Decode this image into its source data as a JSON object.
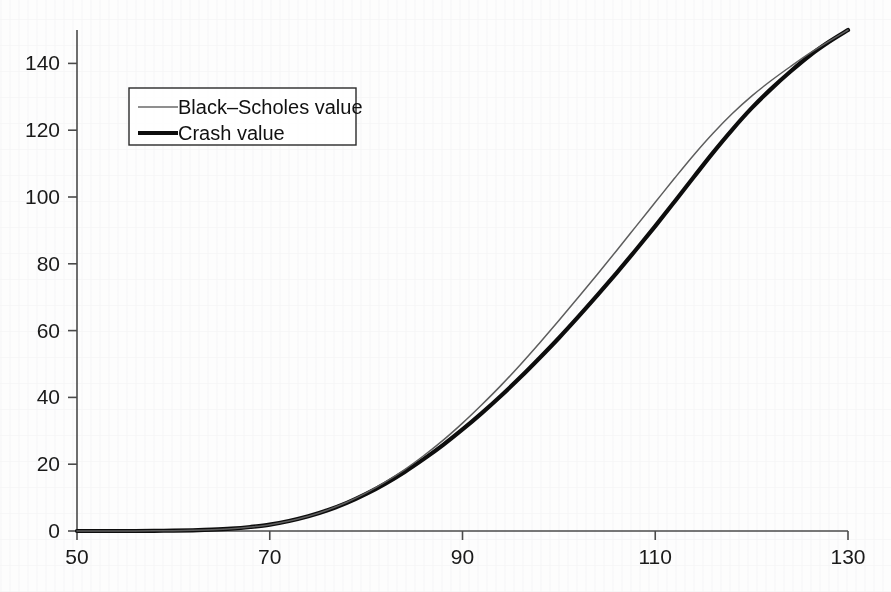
{
  "chart_data": {
    "type": "line",
    "title": "",
    "subtitle": "",
    "xlabel": "",
    "ylabel": "",
    "xlim": [
      50,
      130
    ],
    "ylim": [
      0,
      150
    ],
    "grid": false,
    "legend_position": "upper-left",
    "xticks": [
      50,
      70,
      90,
      110,
      130
    ],
    "xtick_labels": [
      "50",
      "70",
      "90",
      "110",
      "130"
    ],
    "yticks": [
      0,
      20,
      40,
      60,
      80,
      100,
      120,
      140
    ],
    "ytick_labels": [
      "0",
      "20",
      "40",
      "60",
      "80",
      "100",
      "120",
      "140"
    ],
    "x": [
      50,
      52,
      54,
      56,
      58,
      60,
      62,
      64,
      66,
      68,
      70,
      72,
      74,
      76,
      78,
      80,
      82,
      84,
      86,
      88,
      90,
      92,
      94,
      96,
      98,
      100,
      102,
      104,
      106,
      108,
      110,
      112,
      114,
      116,
      118,
      120,
      122,
      124,
      126,
      128,
      130
    ],
    "series": [
      {
        "name": "Black-Scholes value",
        "label": "Black–Scholes value",
        "line_style": "thin",
        "color": "#5d5d5d",
        "width": 1.5,
        "values": [
          0.0,
          0.0,
          0.0,
          0.0,
          0.05,
          0.1,
          0.2,
          0.4,
          0.7,
          1.2,
          1.9,
          3.0,
          4.4,
          6.3,
          8.6,
          11.4,
          14.7,
          18.4,
          22.6,
          27.2,
          32.3,
          37.8,
          43.6,
          49.8,
          56.3,
          63.0,
          69.9,
          76.9,
          84.0,
          91.2,
          98.4,
          105.6,
          112.6,
          119.1,
          125.0,
          130.2,
          134.8,
          139.0,
          143.0,
          146.6,
          150.0
        ]
      },
      {
        "name": "Crash value",
        "label": "Crash value",
        "line_style": "thick",
        "color": "#0d0d0d",
        "width": 4.2,
        "values": [
          0.0,
          0.0,
          0.0,
          0.0,
          0.05,
          0.1,
          0.2,
          0.4,
          0.7,
          1.2,
          1.9,
          3.0,
          4.4,
          6.2,
          8.4,
          11.1,
          14.2,
          17.7,
          21.6,
          25.8,
          30.4,
          35.3,
          40.5,
          46.0,
          51.8,
          57.8,
          64.1,
          70.6,
          77.3,
          84.2,
          91.3,
          98.6,
          106.0,
          113.3,
          120.2,
          126.6,
          132.3,
          137.5,
          142.3,
          146.4,
          150.0
        ]
      }
    ]
  },
  "legend": {
    "entries": [
      {
        "label": "Black–Scholes value",
        "style": "thin"
      },
      {
        "label": "Crash value",
        "style": "thick"
      }
    ]
  },
  "axes": {
    "x_tick_labels": [
      "50",
      "70",
      "90",
      "110",
      "130"
    ],
    "y_tick_labels": [
      "0",
      "20",
      "40",
      "60",
      "80",
      "100",
      "120",
      "140"
    ]
  },
  "colors": {
    "background": "#fdfdfd",
    "axis": "#4a4a4a",
    "black_scholes": "#5d5d5d",
    "crash": "#0d0d0d",
    "text": "#1a1a1a"
  }
}
